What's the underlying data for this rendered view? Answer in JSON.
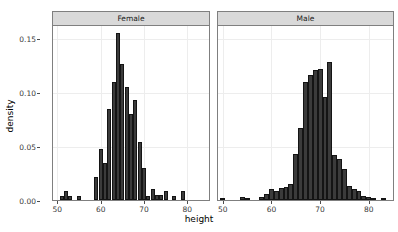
{
  "chart_data": {
    "type": "bar",
    "title": "",
    "xlabel": "height",
    "ylabel": "density",
    "xlim": [
      49,
      85
    ],
    "ylim": [
      0,
      0.162
    ],
    "grid": true,
    "legend": "none",
    "facet_variable": "sex",
    "y_ticks": [
      {
        "value": 0.0,
        "label": "0.00"
      },
      {
        "value": 0.05,
        "label": "0.05"
      },
      {
        "value": 0.1,
        "label": "0.10"
      },
      {
        "value": 0.15,
        "label": "0.15"
      }
    ],
    "facets": [
      {
        "label": "Female",
        "x_ticks": [
          {
            "value": 50,
            "label": "50"
          },
          {
            "value": 60,
            "label": "60"
          },
          {
            "value": 70,
            "label": "70"
          },
          {
            "value": 80,
            "label": "80"
          }
        ],
        "bin_width": 1,
        "bins": [
          {
            "x": 51,
            "density": 0.004
          },
          {
            "x": 52,
            "density": 0.008
          },
          {
            "x": 53,
            "density": 0.004
          },
          {
            "x": 55,
            "density": 0.004
          },
          {
            "x": 59,
            "density": 0.021
          },
          {
            "x": 60,
            "density": 0.047
          },
          {
            "x": 61,
            "density": 0.034
          },
          {
            "x": 62,
            "density": 0.084
          },
          {
            "x": 63,
            "density": 0.109
          },
          {
            "x": 64,
            "density": 0.155
          },
          {
            "x": 65,
            "density": 0.126
          },
          {
            "x": 66,
            "density": 0.105
          },
          {
            "x": 67,
            "density": 0.08
          },
          {
            "x": 68,
            "density": 0.093
          },
          {
            "x": 69,
            "density": 0.054
          },
          {
            "x": 70,
            "density": 0.03
          },
          {
            "x": 71,
            "density": 0.004
          },
          {
            "x": 72,
            "density": 0.01
          },
          {
            "x": 73,
            "density": 0.005
          },
          {
            "x": 74,
            "density": 0.005
          },
          {
            "x": 75,
            "density": 0.008
          },
          {
            "x": 77,
            "density": 0.004
          },
          {
            "x": 79,
            "density": 0.008
          }
        ]
      },
      {
        "label": "Male",
        "x_ticks": [
          {
            "value": 50,
            "label": "50"
          },
          {
            "value": 60,
            "label": "60"
          },
          {
            "value": 70,
            "label": "70"
          },
          {
            "value": 80,
            "label": "80"
          }
        ],
        "bin_width": 1,
        "bins": [
          {
            "x": 50,
            "density": 0.002
          },
          {
            "x": 54,
            "density": 0.003
          },
          {
            "x": 55,
            "density": 0.002
          },
          {
            "x": 58,
            "density": 0.003
          },
          {
            "x": 59,
            "density": 0.006
          },
          {
            "x": 60,
            "density": 0.01
          },
          {
            "x": 61,
            "density": 0.008
          },
          {
            "x": 62,
            "density": 0.011
          },
          {
            "x": 63,
            "density": 0.012
          },
          {
            "x": 64,
            "density": 0.015
          },
          {
            "x": 65,
            "density": 0.043
          },
          {
            "x": 66,
            "density": 0.067
          },
          {
            "x": 67,
            "density": 0.109
          },
          {
            "x": 68,
            "density": 0.116
          },
          {
            "x": 69,
            "density": 0.12
          },
          {
            "x": 70,
            "density": 0.121
          },
          {
            "x": 71,
            "density": 0.095
          },
          {
            "x": 72,
            "density": 0.128
          },
          {
            "x": 73,
            "density": 0.042
          },
          {
            "x": 74,
            "density": 0.038
          },
          {
            "x": 75,
            "density": 0.029
          },
          {
            "x": 76,
            "density": 0.013
          },
          {
            "x": 77,
            "density": 0.01
          },
          {
            "x": 78,
            "density": 0.008
          },
          {
            "x": 79,
            "density": 0.004
          },
          {
            "x": 80,
            "density": 0.003
          },
          {
            "x": 81,
            "density": 0.002
          },
          {
            "x": 83,
            "density": 0.002
          }
        ]
      }
    ]
  },
  "axis": {
    "y_title": "density",
    "x_title": "height"
  }
}
